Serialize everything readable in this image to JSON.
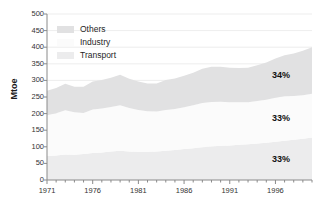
{
  "chart_data": {
    "type": "area",
    "stacked": true,
    "title": "",
    "subtitle": "",
    "xlabel": "",
    "ylabel": "Mtoe",
    "xlim": [
      1971,
      2000
    ],
    "ylim": [
      0,
      500
    ],
    "ytick_step": 50,
    "grid": true,
    "legend_position": "top-left-inside",
    "x": [
      1971,
      1972,
      1973,
      1974,
      1975,
      1976,
      1977,
      1978,
      1979,
      1980,
      1981,
      1982,
      1983,
      1984,
      1985,
      1986,
      1987,
      1988,
      1989,
      1990,
      1991,
      1992,
      1993,
      1994,
      1995,
      1996,
      1997,
      1998,
      1999,
      2000
    ],
    "ytick_labels": [
      "0",
      "50",
      "100",
      "150",
      "200",
      "250",
      "300",
      "350",
      "400",
      "450",
      "500"
    ],
    "ytick_values": [
      0,
      50,
      100,
      150,
      200,
      250,
      300,
      350,
      400,
      450,
      500
    ],
    "xtick_labels": [
      "1971",
      "1976",
      "1981",
      "1986",
      "1991",
      "1996"
    ],
    "xtick_values": [
      1971,
      1976,
      1981,
      1986,
      1991,
      1996
    ],
    "series": [
      {
        "name": "Transport",
        "color": "#ececed",
        "values": [
          72,
          74,
          77,
          76,
          78,
          81,
          83,
          86,
          88,
          86,
          85,
          85,
          86,
          88,
          90,
          93,
          96,
          99,
          101,
          103,
          104,
          106,
          108,
          110,
          112,
          115,
          118,
          121,
          124,
          128
        ]
      },
      {
        "name": "Industry",
        "color": "#fbfbfb",
        "values": [
          123,
          127,
          133,
          128,
          124,
          131,
          132,
          134,
          137,
          131,
          126,
          122,
          120,
          123,
          124,
          126,
          129,
          133,
          134,
          133,
          130,
          128,
          126,
          128,
          130,
          133,
          134,
          132,
          131,
          132
        ]
      },
      {
        "name": "Others",
        "color": "#e1e1e2",
        "values": [
          74,
          76,
          80,
          77,
          79,
          85,
          86,
          88,
          92,
          88,
          86,
          84,
          85,
          90,
          92,
          95,
          98,
          103,
          106,
          105,
          104,
          103,
          104,
          108,
          112,
          118,
          124,
          128,
          134,
          140
        ]
      }
    ],
    "annotations": [
      {
        "name": "others-share",
        "text": "34%",
        "series": "Others"
      },
      {
        "name": "industry-share",
        "text": "33%",
        "series": "Industry"
      },
      {
        "name": "transport-share",
        "text": "33%",
        "series": "Transport"
      }
    ]
  },
  "legend": {
    "items": [
      {
        "label": "Others",
        "color": "#e1e1e2"
      },
      {
        "label": "Industry",
        "color": "#fbfbfb"
      },
      {
        "label": "Transport",
        "color": "#ececed"
      }
    ]
  },
  "axes": {
    "y_title": "Mtoe"
  }
}
